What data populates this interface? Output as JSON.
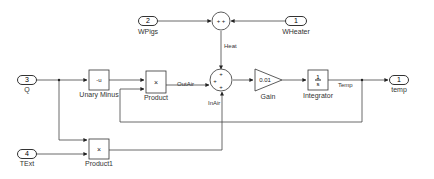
{
  "diagram": {
    "type": "simulink-block-diagram",
    "inports": [
      {
        "number": "2",
        "name": "WPigs"
      },
      {
        "number": "1",
        "name": "WHeater"
      },
      {
        "number": "3",
        "name": "Q"
      },
      {
        "number": "4",
        "name": "TExt"
      }
    ],
    "outports": [
      {
        "number": "1",
        "name": "temp"
      }
    ],
    "blocks": {
      "unary_minus": {
        "glyph": "-u",
        "name": "Unary Minus"
      },
      "product": {
        "glyph": "×",
        "name": "Product"
      },
      "product1": {
        "glyph": "×",
        "name": "Product1"
      },
      "sum_top": {
        "signs": "+ +"
      },
      "sum_main": {
        "signs": [
          "+",
          "+",
          "+"
        ]
      },
      "gain": {
        "value": "0.01",
        "name": "Gain"
      },
      "integrator": {
        "num": "1",
        "den": "s",
        "name": "Integrator"
      }
    },
    "signals": {
      "heat": "Heat",
      "outair": "OutAir",
      "inair": "InAir",
      "temp": "Temp"
    },
    "colors": {
      "line": "#333333",
      "block_border": "#333333",
      "background": "#ffffff"
    }
  }
}
